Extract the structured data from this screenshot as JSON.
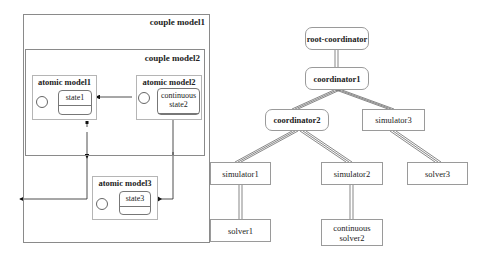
{
  "model_view": {
    "couple_model1": {
      "label": "couple model1"
    },
    "couple_model2": {
      "label": "couple model2"
    },
    "atomic_model1": {
      "label": "atomic model1",
      "state": "state1"
    },
    "atomic_model2": {
      "label": "atomic model2",
      "state_line1": "continuous",
      "state_line2": "state2"
    },
    "atomic_model3": {
      "label": "atomic model3",
      "state": "state3"
    }
  },
  "simulation_tree": {
    "root": {
      "label": "root-coordinator"
    },
    "coordinator1": {
      "label": "coordinator1"
    },
    "coordinator2": {
      "label": "coordinator2"
    },
    "simulator1": {
      "label": "simulator1"
    },
    "simulator2": {
      "label": "simulator2"
    },
    "simulator3": {
      "label": "simulator3"
    },
    "solver1": {
      "label": "solver1"
    },
    "solver2": {
      "line1": "continuous",
      "line2": "solver2"
    },
    "solver3": {
      "label": "solver3"
    }
  },
  "colors": {
    "line": "#222222",
    "border": "#9a9a9a",
    "double_arrow": "#555555"
  }
}
